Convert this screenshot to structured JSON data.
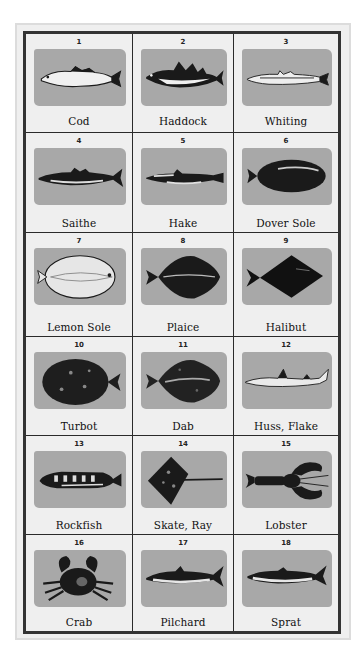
{
  "chart_title": "Fish identification chart",
  "colors": {
    "frame_border": "#333333",
    "outer_border": "#dcdcdc",
    "cell_background": "#efefef",
    "image_panel": "#a8a8a8",
    "creature": "#1a1a1a"
  },
  "items": [
    {
      "number": "1",
      "name": "Cod",
      "icon": "cod-fish-icon"
    },
    {
      "number": "2",
      "name": "Haddock",
      "icon": "haddock-fish-icon"
    },
    {
      "number": "3",
      "name": "Whiting",
      "icon": "whiting-fish-icon"
    },
    {
      "number": "4",
      "name": "Saithe",
      "icon": "saithe-fish-icon"
    },
    {
      "number": "5",
      "name": "Hake",
      "icon": "hake-fish-icon"
    },
    {
      "number": "6",
      "name": "Dover Sole",
      "icon": "dover-sole-fish-icon"
    },
    {
      "number": "7",
      "name": "Lemon Sole",
      "icon": "lemon-sole-fish-icon"
    },
    {
      "number": "8",
      "name": "Plaice",
      "icon": "plaice-fish-icon"
    },
    {
      "number": "9",
      "name": "Halibut",
      "icon": "halibut-fish-icon"
    },
    {
      "number": "10",
      "name": "Turbot",
      "icon": "turbot-fish-icon"
    },
    {
      "number": "11",
      "name": "Dab",
      "icon": "dab-fish-icon"
    },
    {
      "number": "12",
      "name": "Huss, Flake",
      "icon": "huss-shark-icon"
    },
    {
      "number": "13",
      "name": "Rockfish",
      "icon": "rockfish-fish-icon"
    },
    {
      "number": "14",
      "name": "Skate, Ray",
      "icon": "skate-ray-icon"
    },
    {
      "number": "15",
      "name": "Lobster",
      "icon": "lobster-icon"
    },
    {
      "number": "16",
      "name": "Crab",
      "icon": "crab-icon"
    },
    {
      "number": "17",
      "name": "Pilchard",
      "icon": "pilchard-fish-icon"
    },
    {
      "number": "18",
      "name": "Sprat",
      "icon": "sprat-fish-icon"
    }
  ]
}
